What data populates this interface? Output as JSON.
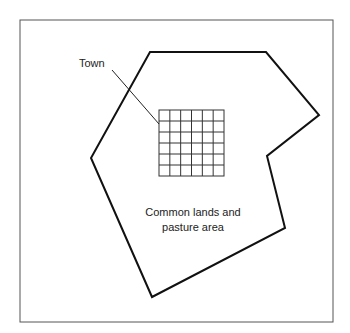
{
  "diagram": {
    "labels": {
      "town": "Town",
      "commons_line1": "Common lands and",
      "commons_line2": "pasture area"
    },
    "frame": {
      "x": 20,
      "y": 20,
      "width": 313,
      "height": 302,
      "stroke": "#555555"
    },
    "boundary": {
      "points": "150,52 266,52 319,115 267,156 285,228 152,297 91,158",
      "stroke": "#111111"
    },
    "town_grid": {
      "x": 159,
      "y": 110,
      "width": 65,
      "height": 66,
      "rows": 6,
      "cols": 6,
      "stroke": "#333333"
    },
    "leader_line": {
      "x1": 112,
      "y1": 70,
      "x2": 159,
      "y2": 124
    }
  }
}
